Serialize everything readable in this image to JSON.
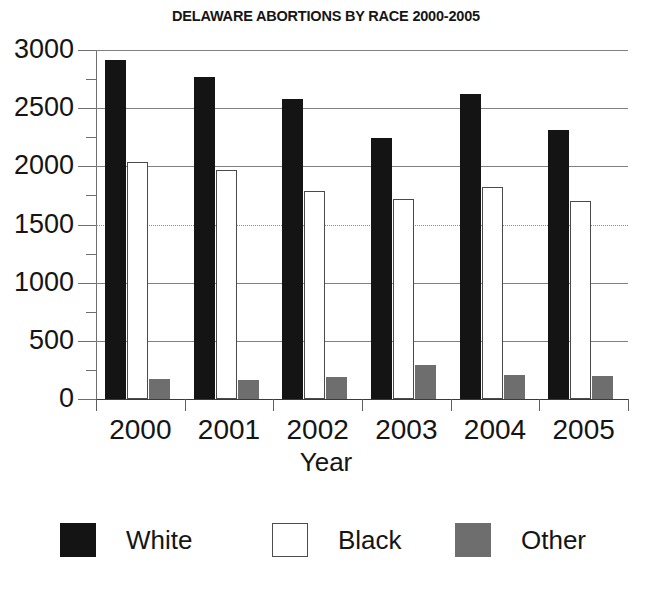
{
  "chart_data": {
    "type": "bar",
    "title": "DELAWARE ABORTIONS BY RACE 2000-2005",
    "xlabel": "Year",
    "ylabel": "",
    "categories": [
      "2000",
      "2001",
      "2002",
      "2003",
      "2004",
      "2005"
    ],
    "series": [
      {
        "name": "White",
        "color": "#141414",
        "values": [
          2910,
          2770,
          2575,
          2245,
          2620,
          2315
        ]
      },
      {
        "name": "Black",
        "color": "#ffffff",
        "values": [
          2035,
          1965,
          1790,
          1720,
          1825,
          1705
        ]
      },
      {
        "name": "Other",
        "color": "#6e6e6e",
        "values": [
          175,
          160,
          190,
          290,
          210,
          200
        ]
      }
    ],
    "ylim": [
      0,
      3000
    ],
    "y_major_ticks": [
      0,
      500,
      1000,
      1500,
      2000,
      2500,
      3000
    ],
    "y_minor_ticks": [
      250,
      750,
      1250,
      1750,
      2250,
      2750
    ],
    "y_tick_labels": [
      "0",
      "500",
      "1000",
      "1500",
      "2000",
      "2500",
      "3000"
    ],
    "grid": true,
    "legend_position": "bottom"
  },
  "legend": {
    "entries": [
      {
        "label": "White"
      },
      {
        "label": "Black"
      },
      {
        "label": "Other"
      }
    ]
  }
}
